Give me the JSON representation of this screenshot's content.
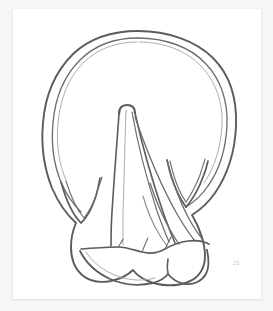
{
  "document": {
    "kind": "scanned-line-drawing",
    "medium": "pen-and-ink on white plate",
    "plate_number": "25",
    "subject": "horse hoof, ground (solar) surface",
    "background_color": "#f6f6f6",
    "plate_color": "#ffffff",
    "ink_color": "#6e6c6d"
  },
  "figure": {
    "caption": "",
    "parts": [
      {
        "name": "hoof-wall-outer-outline",
        "description": "outer bounding oval of the hoof wall"
      },
      {
        "name": "hoof-wall-inner-outline",
        "description": "inner parallel line of the hoof wall, white line"
      },
      {
        "name": "frog-apex",
        "description": "rounded point of the frog near the centre of the sole"
      },
      {
        "name": "frog-body",
        "description": "triangular central frog tapering toward the heels"
      },
      {
        "name": "central-sulcus",
        "description": "central cleft line running down the frog"
      },
      {
        "name": "left-collateral-groove",
        "description": "V-shaped groove on the left side"
      },
      {
        "name": "right-collateral-groove",
        "description": "V-shaped groove on the right side"
      },
      {
        "name": "sole-radiating-lines",
        "description": "fan of lines spreading from the frog toward the heel region"
      },
      {
        "name": "heel-bulbs",
        "description": "paired rounded bulbs at the bottom of the hoof"
      },
      {
        "name": "heel-cleft",
        "description": "notch between the two heel bulbs"
      }
    ]
  },
  "annotations": {
    "plate_number_label": "25"
  }
}
